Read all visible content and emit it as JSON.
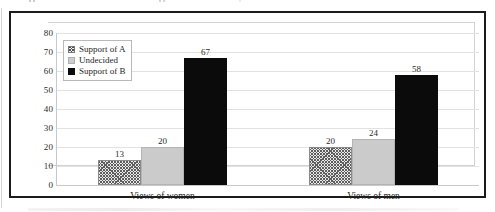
{
  "chart_data": {
    "type": "bar",
    "title": "",
    "subtitle": "",
    "xlabel": "",
    "ylabel": "",
    "categories": [
      "Views of women",
      "Views of men"
    ],
    "series": [
      {
        "name": "Support of A",
        "values": [
          13,
          20
        ],
        "fill": "checkered-hatch",
        "color": "#5d5d5d"
      },
      {
        "name": "Undecided",
        "values": [
          20,
          24
        ],
        "fill": "solid",
        "color": "#cbcbcb"
      },
      {
        "name": "Support of B",
        "values": [
          67,
          58
        ],
        "fill": "solid",
        "color": "#0b0b0b"
      }
    ],
    "ylim": [
      0,
      80
    ],
    "ytick_step": 10,
    "yticks": [
      80,
      70,
      60,
      50,
      40,
      30,
      20,
      10,
      0
    ],
    "ytick_labels": [
      "80",
      "70",
      "60",
      "50",
      "40",
      "30",
      "20",
      "10",
      "0"
    ],
    "data_labels": [
      {
        "group": "Views of women",
        "series": "Support of A",
        "text": "13"
      },
      {
        "group": "Views of women",
        "series": "Undecided",
        "text": "20"
      },
      {
        "group": "Views of women",
        "series": "Support of B",
        "text": "67"
      },
      {
        "group": "Views of men",
        "series": "Support of A",
        "text": "20"
      },
      {
        "group": "Views of men",
        "series": "Undecided",
        "text": "24"
      },
      {
        "group": "Views of men",
        "series": "Support of B",
        "text": "58"
      }
    ],
    "grid": true,
    "grid_axis": "y",
    "legend_position": "upper-left-inside",
    "legend_entries": [
      "Support of A",
      "Undecided",
      "Support of B"
    ],
    "colors": {
      "series_a": "#5d5d5d",
      "series_b": "#cbcbcb",
      "series_c": "#0b0b0b",
      "gridline": "#e2e2e2",
      "axis": "#c9c9c9",
      "frame": "#1b1b1b",
      "text": "#232323"
    }
  }
}
